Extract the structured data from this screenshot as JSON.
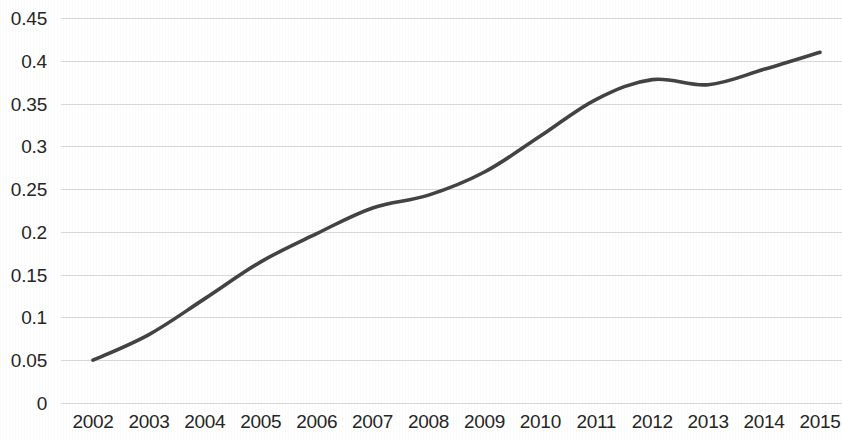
{
  "chart_data": {
    "type": "line",
    "title": "",
    "subtitle": "",
    "xlabel": "",
    "ylabel": "",
    "categories": [
      "2002",
      "2003",
      "2004",
      "2005",
      "2006",
      "2007",
      "2008",
      "2009",
      "2010",
      "2011",
      "2012",
      "2013",
      "2014",
      "2015"
    ],
    "values": [
      0.05,
      0.08,
      0.122,
      0.165,
      0.198,
      0.228,
      0.243,
      0.27,
      0.312,
      0.355,
      0.378,
      0.372,
      0.39,
      0.41
    ],
    "series": [
      {
        "name": "",
        "values": [
          0.05,
          0.08,
          0.122,
          0.165,
          0.198,
          0.228,
          0.243,
          0.27,
          0.312,
          0.355,
          0.378,
          0.372,
          0.39,
          0.41
        ]
      }
    ],
    "ylim": [
      0,
      0.45
    ],
    "ytick_labels": [
      "0",
      "0.05",
      "0.1",
      "0.15",
      "0.2",
      "0.25",
      "0.3",
      "0.35",
      "0.4",
      "0.45"
    ],
    "ytick_values": [
      0,
      0.05,
      0.1,
      0.15,
      0.2,
      0.25,
      0.3,
      0.35,
      0.4,
      0.45
    ],
    "xtick_labels": [
      "2002",
      "2003",
      "2004",
      "2005",
      "2006",
      "2007",
      "2008",
      "2009",
      "2010",
      "2011",
      "2012",
      "2013",
      "2014",
      "2015"
    ],
    "grid": "horizontal",
    "legend": "none",
    "markers": "none",
    "line_color": "#434343",
    "grid_color": "#d6d6d6",
    "text_color": "#262626",
    "background_color": "#ffffff",
    "annotations": []
  }
}
